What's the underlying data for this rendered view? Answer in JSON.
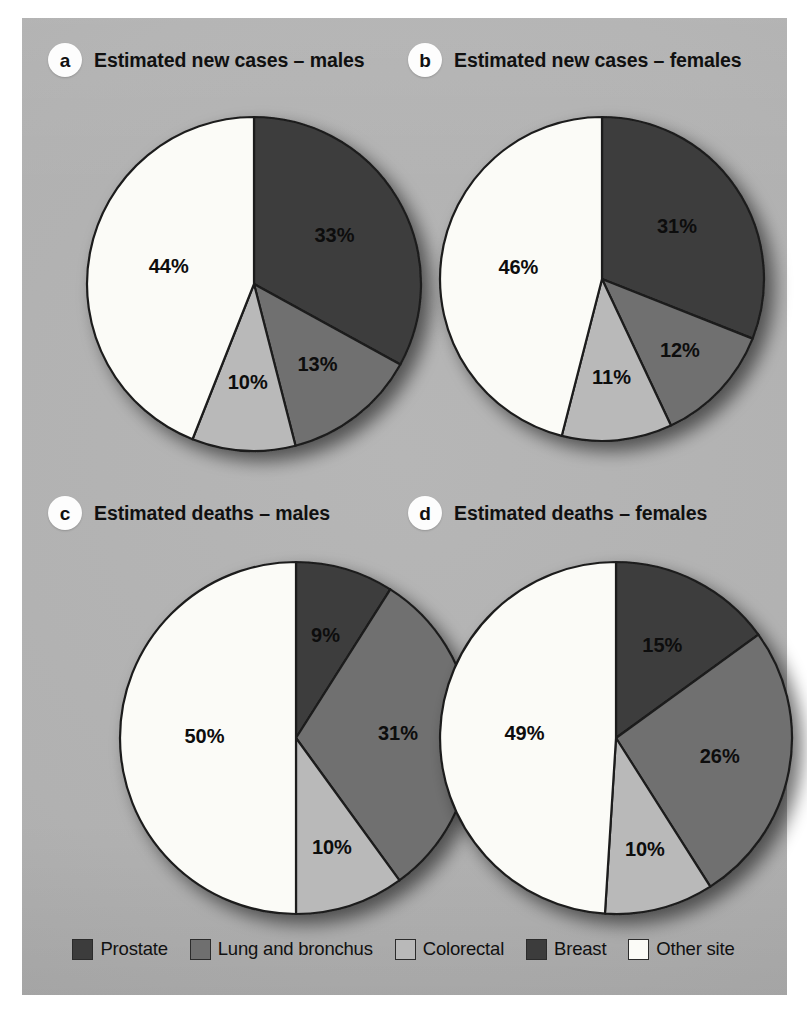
{
  "figure": {
    "background_color": "#b1b1b1",
    "page_color": "#ffffff"
  },
  "palette": {
    "prostate": "#3c3c3c",
    "lung_and_bronchus": "#6f6f6f",
    "colorectal": "#b9b9b9",
    "breast": "#3c3c3c",
    "other_site": "#fbfbf7",
    "outline": "#1c1c1c",
    "label_text": "#0d0d0d"
  },
  "legend": {
    "items": [
      {
        "label": "Prostate",
        "key": "prostate",
        "color": "#3c3c3c"
      },
      {
        "label": "Lung and bronchus",
        "key": "lung_and_bronchus",
        "color": "#6f6f6f"
      },
      {
        "label": "Colorectal",
        "key": "colorectal",
        "color": "#b9b9b9"
      },
      {
        "label": "Breast",
        "key": "breast",
        "color": "#3c3c3c"
      },
      {
        "label": "Other site",
        "key": "other_site",
        "color": "#fbfbf7"
      }
    ]
  },
  "panels": [
    {
      "badge": "a",
      "title": "Estimated new cases – males",
      "labels": [
        "33%",
        "13%",
        "10%",
        "44%"
      ]
    },
    {
      "badge": "b",
      "title": "Estimated new cases – females",
      "labels": [
        "31%",
        "12%",
        "11%",
        "46%"
      ]
    },
    {
      "badge": "c",
      "title": "Estimated deaths – males",
      "labels": [
        "9%",
        "31%",
        "10%",
        "50%"
      ]
    },
    {
      "badge": "d",
      "title": "Estimated deaths – females",
      "labels": [
        "15%",
        "26%",
        "10%",
        "49%"
      ]
    }
  ],
  "chart_data": [
    {
      "type": "pie",
      "id": "a",
      "title": "Estimated new cases – males",
      "categories": [
        "Prostate",
        "Lung and bronchus",
        "Colorectal",
        "Other site"
      ],
      "values": [
        33,
        13,
        10,
        44
      ],
      "value_labels": [
        "33%",
        "13%",
        "10%",
        "44%"
      ],
      "colors": [
        "#3c3c3c",
        "#6f6f6f",
        "#b9b9b9",
        "#fbfbf7"
      ],
      "units": "percent",
      "start_angle_deg": 0,
      "direction": "clockwise",
      "legend_position": "bottom"
    },
    {
      "type": "pie",
      "id": "b",
      "title": "Estimated new cases – females",
      "categories": [
        "Breast",
        "Lung and bronchus",
        "Colorectal",
        "Other site"
      ],
      "values": [
        31,
        12,
        11,
        46
      ],
      "value_labels": [
        "31%",
        "12%",
        "11%",
        "46%"
      ],
      "colors": [
        "#3c3c3c",
        "#6f6f6f",
        "#b9b9b9",
        "#fbfbf7"
      ],
      "units": "percent",
      "start_angle_deg": 0,
      "direction": "clockwise",
      "legend_position": "bottom"
    },
    {
      "type": "pie",
      "id": "c",
      "title": "Estimated deaths – males",
      "categories": [
        "Prostate",
        "Lung and bronchus",
        "Colorectal",
        "Other site"
      ],
      "values": [
        9,
        31,
        10,
        50
      ],
      "value_labels": [
        "9%",
        "31%",
        "10%",
        "50%"
      ],
      "colors": [
        "#3c3c3c",
        "#6f6f6f",
        "#b9b9b9",
        "#fbfbf7"
      ],
      "units": "percent",
      "start_angle_deg": 0,
      "direction": "clockwise",
      "legend_position": "bottom"
    },
    {
      "type": "pie",
      "id": "d",
      "title": "Estimated deaths – females",
      "categories": [
        "Breast",
        "Lung and bronchus",
        "Colorectal",
        "Other site"
      ],
      "values": [
        15,
        26,
        10,
        49
      ],
      "value_labels": [
        "15%",
        "26%",
        "10%",
        "49%"
      ],
      "colors": [
        "#3c3c3c",
        "#6f6f6f",
        "#b9b9b9",
        "#fbfbf7"
      ],
      "units": "percent",
      "start_angle_deg": 0,
      "direction": "clockwise",
      "legend_position": "bottom"
    }
  ]
}
